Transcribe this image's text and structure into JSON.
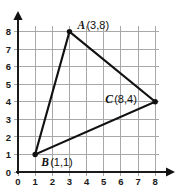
{
  "chart_data": {
    "type": "scatter",
    "title": "",
    "xlabel": "",
    "ylabel": "",
    "xlim": [
      0,
      8
    ],
    "ylim": [
      0,
      8
    ],
    "grid": true,
    "legend": "none",
    "x_ticks": [
      "0",
      "1",
      "2",
      "3",
      "4",
      "5",
      "6",
      "7",
      "8"
    ],
    "y_ticks": [
      "0",
      "1",
      "2",
      "3",
      "4",
      "5",
      "6",
      "7",
      "8"
    ],
    "points": [
      {
        "name": "A",
        "coords": "(3,8)",
        "x": 3,
        "y": 8,
        "label": "A (3,8)"
      },
      {
        "name": "B",
        "coords": "(1,1)",
        "x": 1,
        "y": 1,
        "label": "B (1,1)"
      },
      {
        "name": "C",
        "coords": "(8,4)",
        "x": 8,
        "y": 4,
        "label": "C (8,4)"
      }
    ],
    "shape": "triangle",
    "shape_vertices": [
      "A",
      "B",
      "C"
    ],
    "colors": {
      "grid": "#a8a8a8",
      "axis": "#1a1a1a",
      "edge": "#111111",
      "vertex": "#111111",
      "background": "#ffffff"
    }
  }
}
